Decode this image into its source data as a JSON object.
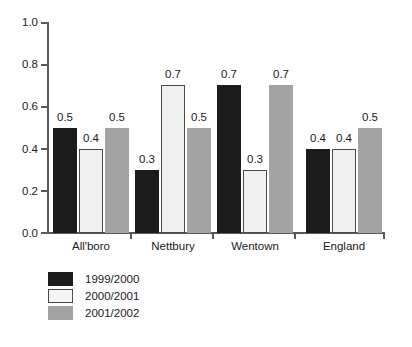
{
  "chart_data": {
    "type": "bar",
    "title": "",
    "subtitle": "",
    "xlabel": "",
    "ylabel": "",
    "categories": [
      "All'boro",
      "Nettbury",
      "Wentown",
      "England"
    ],
    "series": [
      {
        "name": "1999/2000",
        "color": "#1b1b1b",
        "values": [
          0.5,
          0.3,
          0.7,
          0.4
        ]
      },
      {
        "name": "2000/2001",
        "color": "#f0f0f0",
        "values": [
          0.4,
          0.7,
          0.3,
          0.4
        ]
      },
      {
        "name": "2001/2002",
        "color": "#a3a3a3",
        "values": [
          0.5,
          0.5,
          0.7,
          0.5
        ]
      }
    ],
    "value_labels": [
      [
        "0.5",
        "0.3",
        "0.7",
        "0.4"
      ],
      [
        "0.4",
        "0.7",
        "0.3",
        "0.4"
      ],
      [
        "0.5",
        "0.5",
        "0.7",
        "0.5"
      ]
    ],
    "ylim": [
      0.0,
      1.0
    ],
    "ytick_values": [
      0.0,
      0.2,
      0.4,
      0.6,
      0.8,
      1.0
    ],
    "ytick_labels": [
      "0.0",
      "0.2",
      "0.4",
      "0.6",
      "0.8",
      "1.0"
    ],
    "grid": false,
    "legend_position": "bottom-left"
  },
  "axis": {
    "y_labels": [
      "1.0",
      "0.8",
      "0.6",
      "0.4",
      "0.2",
      "0.0"
    ]
  },
  "legend": {
    "items": [
      {
        "label": "1999/2000"
      },
      {
        "label": "2000/2001"
      },
      {
        "label": "2001/2002"
      }
    ]
  }
}
